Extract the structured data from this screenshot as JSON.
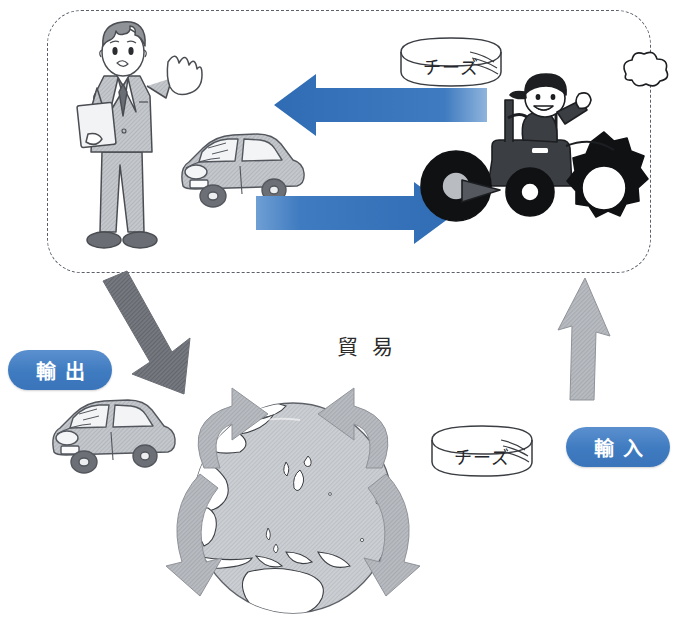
{
  "diagram": {
    "title_label": "貿易",
    "panel": {
      "name": "trade-illustration-panel",
      "border_style": "dashed-rounded"
    },
    "badges": [
      {
        "id": "export",
        "label": "輸出",
        "color": "#3f7bc0"
      },
      {
        "id": "import",
        "label": "輸入",
        "color": "#3f7bc0"
      }
    ],
    "objects": {
      "cheese_top_label": "チーズ",
      "cheese_bottom_label": "チーズ",
      "businessman": "businessman-figure",
      "farmer_tractor": "farmer-on-tractor",
      "car_top": "car-illustration",
      "car_bottom": "car-illustration",
      "globe": "earth-globe"
    },
    "arrows": {
      "blue_left_label": "import-flow-arrow",
      "blue_right_label": "export-flow-arrow",
      "gray_down_label": "export-down-arrow",
      "gray_up_label": "import-up-arrow",
      "circulation": "trade-circulation-arrows"
    },
    "colors": {
      "arrow_blue": "#3f7bc0",
      "arrow_gray_dark": "#6e7177",
      "arrow_gray_light": "#9ba0a6",
      "globe_ocean": "#c9ccd0",
      "line": "#3a3d42"
    }
  }
}
